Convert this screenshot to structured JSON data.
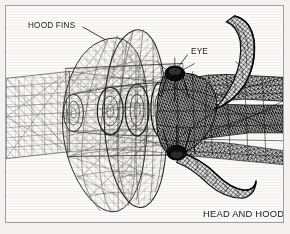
{
  "figure": {
    "caption": "HEAD AND HOOD",
    "border_color": "#9aa0a6",
    "background_color": "#fbfaf8",
    "page_background_color": "#f3f2ef",
    "ink_color": "#1a1a1a",
    "mesh_light_color": "#6d6d6d",
    "mesh_dark_color": "#141414"
  },
  "annotations": [
    {
      "id": "hood-fins",
      "label": "HOOD FINS",
      "leader_from": [
        78,
        22
      ],
      "leader_to": [
        99,
        33
      ]
    },
    {
      "id": "eye",
      "label": "EYE",
      "leader_from": [
        184,
        50
      ],
      "leader_to": [
        170,
        68
      ]
    }
  ],
  "parts": [
    {
      "name": "hood-fin-outer",
      "description": "large triangulated fin surface"
    },
    {
      "name": "hood-fin-inner",
      "description": "second triangulated fin surface"
    },
    {
      "name": "body-tube-left",
      "description": "rectangular grid tube exiting left edge"
    },
    {
      "name": "neck-tube-right",
      "description": "dark mesh neck exiting right edge"
    },
    {
      "name": "horn-upper",
      "description": "curved hooked horn, upper right"
    },
    {
      "name": "horn-lower",
      "description": "curved hooked horn, lower right"
    },
    {
      "name": "eye-node",
      "description": "dark elliptical eye boss"
    },
    {
      "name": "jaw-node",
      "description": "dark elliptical lower boss"
    },
    {
      "name": "section-rings",
      "description": "concentric oval cross sections"
    }
  ]
}
